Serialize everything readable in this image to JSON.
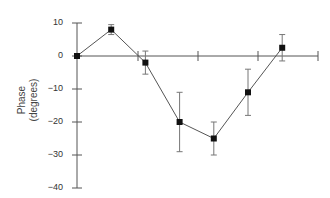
{
  "chart_data": {
    "type": "line",
    "title": "",
    "xlabel": "",
    "ylabel": "Phase (degrees)",
    "ylabel_lines": [
      "Phase",
      "(degrees)"
    ],
    "ylim": [
      -40,
      10
    ],
    "yticks": [
      10,
      0,
      -10,
      -20,
      -30,
      -40
    ],
    "ytick_labels": [
      "10",
      "0",
      "−10",
      "−20",
      "−30",
      "−40"
    ],
    "grid": false,
    "legend": null,
    "series": [
      {
        "name": "Phase",
        "x": [
          0,
          1,
          2,
          3,
          4,
          5,
          6
        ],
        "values": [
          0,
          8,
          -2,
          -20,
          -25,
          -11,
          2.5
        ],
        "error": [
          0,
          1.5,
          3.5,
          9,
          5,
          7,
          4
        ]
      }
    ]
  }
}
